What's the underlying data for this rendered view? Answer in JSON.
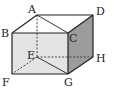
{
  "diagram": {
    "type": "cuboid",
    "colors": {
      "front_face": "#e4e4e4",
      "right_face": "#9c9c9c",
      "top_face": "#ffffff",
      "edge": "#222222"
    },
    "vertices": {
      "A": {
        "label": "A",
        "x": 37,
        "y": 15
      },
      "B": {
        "label": "B",
        "x": 12,
        "y": 33
      },
      "C": {
        "label": "C",
        "x": 68,
        "y": 33
      },
      "D": {
        "label": "D",
        "x": 93,
        "y": 15
      },
      "E": {
        "label": "E",
        "x": 37,
        "y": 57
      },
      "F": {
        "label": "F",
        "x": 12,
        "y": 74
      },
      "G": {
        "label": "G",
        "x": 68,
        "y": 74
      },
      "H": {
        "label": "H",
        "x": 93,
        "y": 57
      }
    },
    "solid_edges": [
      [
        "A",
        "B"
      ],
      [
        "A",
        "D"
      ],
      [
        "B",
        "C"
      ],
      [
        "C",
        "D"
      ],
      [
        "B",
        "F"
      ],
      [
        "C",
        "G"
      ],
      [
        "F",
        "G"
      ],
      [
        "G",
        "H"
      ],
      [
        "D",
        "H"
      ],
      [
        "A",
        "C"
      ],
      [
        "E",
        "G"
      ]
    ],
    "dashed_edges": [
      [
        "A",
        "E"
      ],
      [
        "E",
        "F"
      ],
      [
        "E",
        "H"
      ]
    ]
  }
}
